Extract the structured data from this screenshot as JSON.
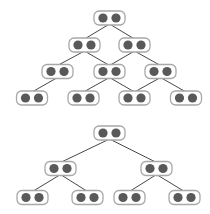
{
  "diagram": {
    "style": {
      "node_border": "#a8a8a8",
      "node_fill": "#ffffff",
      "dot_fill": "#595959",
      "edge_color": "#474747",
      "node_w": 31,
      "node_h": 14,
      "dot_r": 4.6
    },
    "graphs": [
      {
        "name": "top-dag",
        "nodes": [
          {
            "id": "a",
            "x": 109.5,
            "y": 18
          },
          {
            "id": "b",
            "x": 84.5,
            "y": 45
          },
          {
            "id": "c",
            "x": 134.5,
            "y": 45
          },
          {
            "id": "d",
            "x": 57.5,
            "y": 71.5
          },
          {
            "id": "e",
            "x": 109.5,
            "y": 71.5
          },
          {
            "id": "f",
            "x": 160.5,
            "y": 71.5
          },
          {
            "id": "g",
            "x": 32,
            "y": 98
          },
          {
            "id": "h",
            "x": 83.5,
            "y": 98
          },
          {
            "id": "i",
            "x": 134.5,
            "y": 98
          },
          {
            "id": "j",
            "x": 186,
            "y": 98
          }
        ],
        "edges": [
          [
            "a",
            "b"
          ],
          [
            "a",
            "c"
          ],
          [
            "b",
            "d"
          ],
          [
            "b",
            "e"
          ],
          [
            "c",
            "e"
          ],
          [
            "c",
            "f"
          ],
          [
            "d",
            "g"
          ],
          [
            "e",
            "h"
          ],
          [
            "e",
            "i"
          ],
          [
            "f",
            "i"
          ],
          [
            "f",
            "j"
          ]
        ]
      },
      {
        "name": "bottom-tree",
        "nodes": [
          {
            "id": "r",
            "x": 109.5,
            "y": 133
          },
          {
            "id": "s",
            "x": 60.5,
            "y": 168.5
          },
          {
            "id": "t",
            "x": 156.5,
            "y": 168.5
          },
          {
            "id": "u",
            "x": 32.5,
            "y": 197.5
          },
          {
            "id": "v",
            "x": 87.5,
            "y": 197.5
          },
          {
            "id": "w",
            "x": 129.5,
            "y": 197.5
          },
          {
            "id": "x",
            "x": 184.5,
            "y": 197.5
          }
        ],
        "edges": [
          [
            "r",
            "s"
          ],
          [
            "r",
            "t"
          ],
          [
            "s",
            "u"
          ],
          [
            "s",
            "v"
          ],
          [
            "t",
            "w"
          ],
          [
            "t",
            "x"
          ]
        ]
      }
    ]
  }
}
